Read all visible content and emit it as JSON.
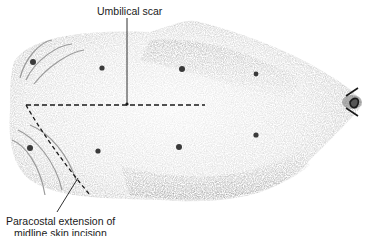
{
  "figure": {
    "labels": {
      "umbilical_scar": "Umbilical scar",
      "paracostal_line1": "Paracostal extension of",
      "paracostal_line2": "midline skin incision"
    },
    "colors": {
      "skin_light": "#e6e6e6",
      "skin_shade": "#9a9a9a",
      "ink": "#1a1a1a",
      "background": "#ffffff"
    },
    "nipple_count": 8
  }
}
